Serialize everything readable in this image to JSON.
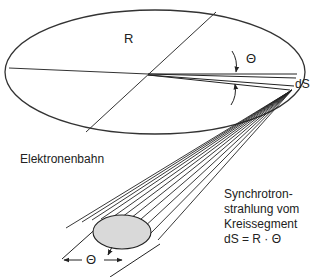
{
  "diagram": {
    "labels": {
      "radius": "R",
      "angle_top": "Θ",
      "segment": "dS",
      "orbit": "Elektronenbahn",
      "note_line1": "Synchrotron-",
      "note_line2": "strahlung vom",
      "note_line3": "Kreissegment",
      "note_line4": "dS = R · Θ",
      "angle_bottom": "Θ"
    },
    "colors": {
      "line": "#222222",
      "beam_fill": "#d9d9d9"
    }
  }
}
